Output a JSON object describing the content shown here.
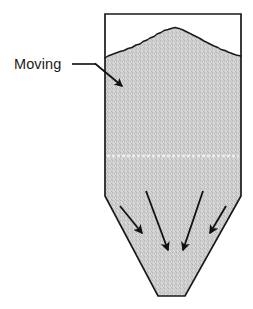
{
  "diagram": {
    "background_color": "#ffffff",
    "annotations": [
      {
        "id": "moving-label",
        "label": "Moving",
        "text_x": 14,
        "text_y": 69,
        "leader_line": {
          "x1": 72,
          "y1": 64,
          "x2": 96,
          "y2": 64
        },
        "pointer_line": {
          "x1": 96,
          "y1": 64,
          "x2": 122,
          "y2": 86
        },
        "color": "#1a1a1a"
      }
    ],
    "vessel": {
      "name": "silo-vessel",
      "outline_color": "#1a1a1a",
      "outline_width": 1.6,
      "wall_left_x": 105,
      "wall_right_x": 241,
      "top_y": 14,
      "taper_start_y": 196,
      "outlet_left_x": 158,
      "outlet_right_x": 185,
      "outlet_y": 296
    },
    "bulk_solid": {
      "name": "granular-material-fill",
      "fill_color": "#c9c9c9",
      "texture": "stipple",
      "surface_profile_label": "heaped-pile-surface",
      "surface_peak_x": 175,
      "surface_peak_y": 28,
      "surface_left_x": 105,
      "surface_left_y": 58,
      "surface_right_x": 241,
      "surface_right_y": 56
    },
    "flow_zone_divider": {
      "name": "flow-zone-divider-line",
      "y": 156,
      "x1": 107,
      "x2": 239,
      "color": "#e6e6e6",
      "style": "dashed"
    },
    "flow_arrows": [
      {
        "id": "flow-arrow-1",
        "x1": 120,
        "y1": 206,
        "x2": 142,
        "y2": 233
      },
      {
        "id": "flow-arrow-2",
        "x1": 146,
        "y1": 191,
        "x2": 168,
        "y2": 250
      },
      {
        "id": "flow-arrow-3",
        "x1": 203,
        "y1": 191,
        "x2": 183,
        "y2": 250
      },
      {
        "id": "flow-arrow-4",
        "x1": 226,
        "y1": 206,
        "x2": 210,
        "y2": 233
      }
    ],
    "colors": {
      "line": "#1a1a1a",
      "fill": "#c9c9c9",
      "background": "#ffffff"
    }
  }
}
